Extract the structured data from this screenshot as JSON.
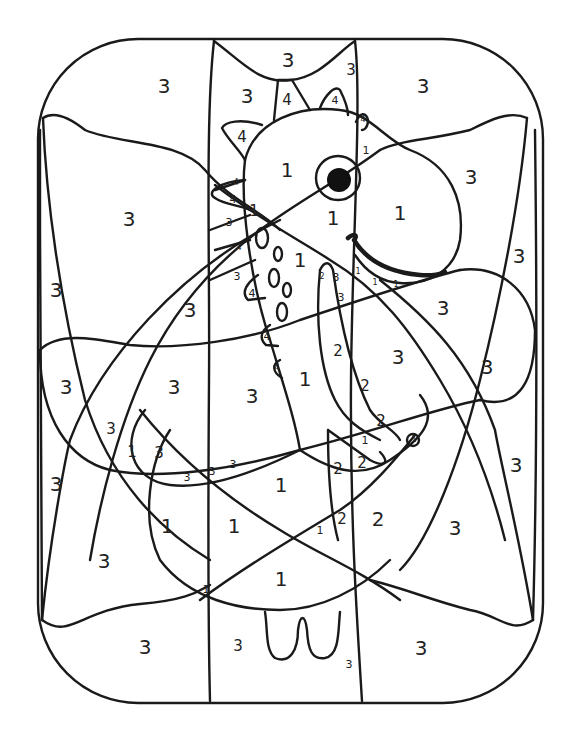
{
  "page": {
    "stroke_color": "#1a1a1a",
    "background": "#ffffff"
  },
  "numbers": [
    {
      "v": "3",
      "x": 164,
      "y": 86,
      "s": "lg"
    },
    {
      "v": "3",
      "x": 247,
      "y": 96,
      "s": "lg"
    },
    {
      "v": "3",
      "x": 288,
      "y": 60,
      "s": "lg"
    },
    {
      "v": "3",
      "x": 351,
      "y": 70,
      "s": "md"
    },
    {
      "v": "3",
      "x": 423,
      "y": 86,
      "s": "lg"
    },
    {
      "v": "4",
      "x": 287,
      "y": 100,
      "s": "md"
    },
    {
      "v": "4",
      "x": 335,
      "y": 100,
      "s": "sm"
    },
    {
      "v": "4",
      "x": 242,
      "y": 137,
      "s": "md"
    },
    {
      "v": "4",
      "x": 363,
      "y": 120,
      "s": "xs"
    },
    {
      "v": "1",
      "x": 366,
      "y": 150,
      "s": "sm"
    },
    {
      "v": "1",
      "x": 287,
      "y": 170,
      "s": "lg"
    },
    {
      "v": "3",
      "x": 471,
      "y": 177,
      "s": "lg"
    },
    {
      "v": "4",
      "x": 236,
      "y": 183,
      "s": "xs"
    },
    {
      "v": "4",
      "x": 233,
      "y": 199,
      "s": "sm"
    },
    {
      "v": "1",
      "x": 254,
      "y": 211,
      "s": "md"
    },
    {
      "v": "3",
      "x": 229,
      "y": 222,
      "s": "sm"
    },
    {
      "v": "4",
      "x": 239,
      "y": 248,
      "s": "xs"
    },
    {
      "v": "3",
      "x": 129,
      "y": 219,
      "s": "lg"
    },
    {
      "v": "1",
      "x": 333,
      "y": 218,
      "s": "lg"
    },
    {
      "v": "1",
      "x": 400,
      "y": 213,
      "s": "lg"
    },
    {
      "v": "1",
      "x": 300,
      "y": 260,
      "s": "lg"
    },
    {
      "v": "3",
      "x": 519,
      "y": 256,
      "s": "lg"
    },
    {
      "v": "3",
      "x": 56,
      "y": 290,
      "s": "lg"
    },
    {
      "v": "3",
      "x": 237,
      "y": 276,
      "s": "sm"
    },
    {
      "v": "4",
      "x": 252,
      "y": 293,
      "s": "sm"
    },
    {
      "v": "2",
      "x": 322,
      "y": 277,
      "s": "xs"
    },
    {
      "v": "3",
      "x": 336,
      "y": 277,
      "s": "sm"
    },
    {
      "v": "1",
      "x": 358,
      "y": 272,
      "s": "xs"
    },
    {
      "v": "1",
      "x": 375,
      "y": 283,
      "s": "xs"
    },
    {
      "v": "1",
      "x": 396,
      "y": 285,
      "s": "xs"
    },
    {
      "v": "3",
      "x": 341,
      "y": 297,
      "s": "sm"
    },
    {
      "v": "3",
      "x": 190,
      "y": 310,
      "s": "lg"
    },
    {
      "v": "3",
      "x": 443,
      "y": 308,
      "s": "lg"
    },
    {
      "v": "4",
      "x": 267,
      "y": 336,
      "s": "sm"
    },
    {
      "v": "2",
      "x": 338,
      "y": 351,
      "s": "md"
    },
    {
      "v": "3",
      "x": 398,
      "y": 357,
      "s": "lg"
    },
    {
      "v": "3",
      "x": 487,
      "y": 367,
      "s": "lg"
    },
    {
      "v": "4",
      "x": 277,
      "y": 368,
      "s": "xs"
    },
    {
      "v": "1",
      "x": 305,
      "y": 379,
      "s": "lg"
    },
    {
      "v": "3",
      "x": 66,
      "y": 387,
      "s": "lg"
    },
    {
      "v": "3",
      "x": 174,
      "y": 387,
      "s": "lg"
    },
    {
      "v": "3",
      "x": 252,
      "y": 396,
      "s": "lg"
    },
    {
      "v": "2",
      "x": 365,
      "y": 386,
      "s": "md"
    },
    {
      "v": "2",
      "x": 381,
      "y": 421,
      "s": "md"
    },
    {
      "v": "3",
      "x": 111,
      "y": 429,
      "s": "md"
    },
    {
      "v": "1",
      "x": 365,
      "y": 440,
      "s": "sm"
    },
    {
      "v": "1",
      "x": 414,
      "y": 440,
      "s": "xs"
    },
    {
      "v": "1",
      "x": 132,
      "y": 452,
      "s": "md"
    },
    {
      "v": "3",
      "x": 159,
      "y": 453,
      "s": "md"
    },
    {
      "v": "2",
      "x": 338,
      "y": 469,
      "s": "md"
    },
    {
      "v": "2",
      "x": 362,
      "y": 463,
      "s": "md"
    },
    {
      "v": "3",
      "x": 516,
      "y": 465,
      "s": "lg"
    },
    {
      "v": "3",
      "x": 233,
      "y": 464,
      "s": "sm"
    },
    {
      "v": "3",
      "x": 212,
      "y": 471,
      "s": "sm"
    },
    {
      "v": "3",
      "x": 187,
      "y": 477,
      "s": "sm"
    },
    {
      "v": "3",
      "x": 56,
      "y": 484,
      "s": "lg"
    },
    {
      "v": "1",
      "x": 281,
      "y": 485,
      "s": "lg"
    },
    {
      "v": "1",
      "x": 167,
      "y": 526,
      "s": "lg"
    },
    {
      "v": "1",
      "x": 234,
      "y": 526,
      "s": "lg"
    },
    {
      "v": "2",
      "x": 342,
      "y": 519,
      "s": "md"
    },
    {
      "v": "1",
      "x": 320,
      "y": 530,
      "s": "sm"
    },
    {
      "v": "2",
      "x": 378,
      "y": 519,
      "s": "lg"
    },
    {
      "v": "3",
      "x": 455,
      "y": 528,
      "s": "lg"
    },
    {
      "v": "3",
      "x": 104,
      "y": 561,
      "s": "lg"
    },
    {
      "v": "1",
      "x": 281,
      "y": 579,
      "s": "lg"
    },
    {
      "v": "1",
      "x": 206,
      "y": 589,
      "s": "sm"
    },
    {
      "v": "3",
      "x": 145,
      "y": 647,
      "s": "lg"
    },
    {
      "v": "3",
      "x": 238,
      "y": 646,
      "s": "md"
    },
    {
      "v": "3",
      "x": 421,
      "y": 648,
      "s": "lg"
    },
    {
      "v": "3",
      "x": 349,
      "y": 664,
      "s": "sm"
    }
  ],
  "legend_values_used": [
    "1",
    "2",
    "3",
    "4"
  ]
}
